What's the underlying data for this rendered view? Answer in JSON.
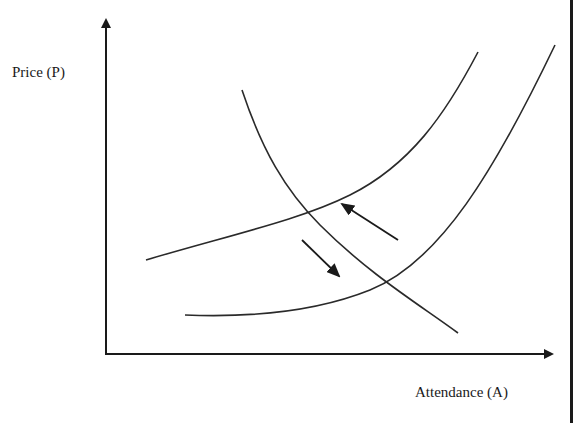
{
  "diagram": {
    "type": "supply-demand-shift",
    "y_axis": {
      "label": "Price (P)"
    },
    "x_axis": {
      "label": "Attendance (A)"
    },
    "curves": [
      {
        "id": "supply-upper",
        "description": "upward-sloping curve (higher position)"
      },
      {
        "id": "supply-lower",
        "description": "upward-sloping curve (lower position)"
      },
      {
        "id": "demand",
        "description": "downward-sloping curve"
      }
    ],
    "arrows": [
      {
        "id": "shift-up-left",
        "direction": "up-left"
      },
      {
        "id": "shift-down-right",
        "direction": "down-right"
      }
    ],
    "colors": {
      "line": "#2a2a2a",
      "axis": "#1a1a1a",
      "background": "#ffffff"
    }
  }
}
